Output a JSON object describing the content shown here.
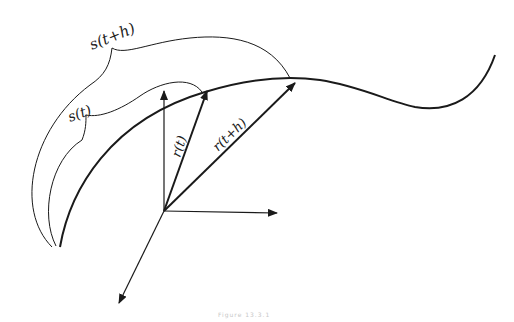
{
  "diagram": {
    "labels": {
      "s_t_plus_h": "s(t+h)",
      "s_t": "s(t)",
      "r_t": "r(t)",
      "r_t_plus_h": "r(t+h)"
    },
    "caption": "Figure 13.3.1",
    "colors": {
      "stroke": "#1a1a1a",
      "background": "#ffffff"
    }
  }
}
